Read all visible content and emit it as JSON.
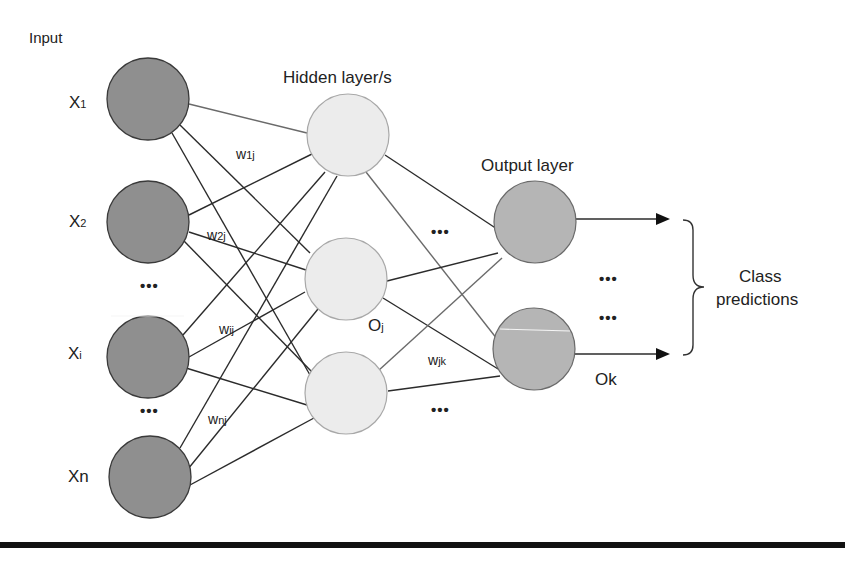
{
  "colors": {
    "input_fill": "#8f8f8f",
    "input_stroke": "#3a3a3a",
    "hidden_fill": "#ececec",
    "hidden_stroke": "#9a9a9a",
    "output_fill": "#b5b5b5",
    "output_stroke": "#6a6a6a",
    "edge": "#2b2b2b",
    "edge_light": "#6a6a6a",
    "rule": "#111111"
  },
  "labels": {
    "input_heading": "Input",
    "hidden_heading": "Hidden layer/s",
    "output_heading": "Output layer",
    "class_predictions_line1": "Class",
    "class_predictions_line2": "predictions"
  },
  "input_nodes": [
    {
      "name": "X",
      "sub": "1"
    },
    {
      "name": "X",
      "sub": "2"
    },
    {
      "name": "X",
      "sub": "i"
    },
    {
      "name": "Xn",
      "sub": ""
    }
  ],
  "weights": {
    "w1j": {
      "w": "w",
      "sub": "1j"
    },
    "w2j": {
      "w": "w",
      "sub": "2j"
    },
    "wij": {
      "w": "w",
      "sub": "ij"
    },
    "wnj": {
      "w": "w",
      "sub": "nj"
    },
    "wjk": {
      "w": "w",
      "sub": "jk"
    }
  },
  "hidden_label": {
    "name": "O",
    "sub": "j"
  },
  "output_label": "Ok",
  "ellipsis": "•••"
}
